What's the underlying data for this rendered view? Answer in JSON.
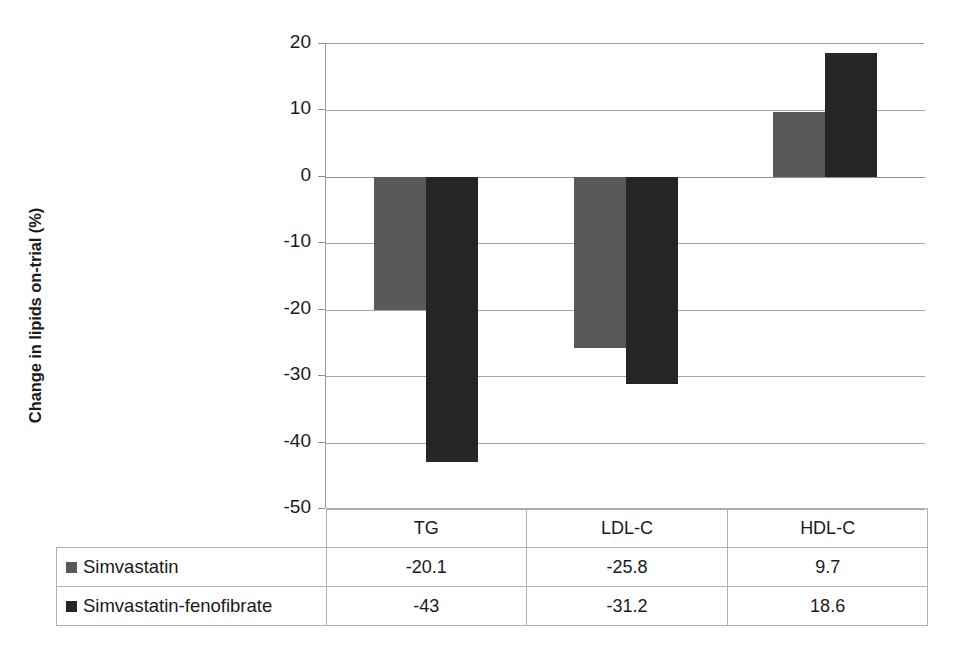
{
  "chart_data": {
    "type": "bar",
    "title": "",
    "xlabel": "",
    "ylabel": "Change in lipids on-trial (%)",
    "categories": [
      "TG",
      "LDL-C",
      "HDL-C"
    ],
    "series": [
      {
        "name": "Simvastatin",
        "color": "#595959",
        "values": [
          -20.1,
          -25.8,
          9.7
        ]
      },
      {
        "name": "Simvastatin-fenofibrate",
        "color": "#262626",
        "values": [
          -43,
          -31.2,
          18.6
        ]
      }
    ],
    "ylim": [
      -50,
      20
    ],
    "yticks": [
      20,
      10,
      0,
      -10,
      -20,
      -30,
      -40,
      -50
    ],
    "ytick_labels": [
      "20",
      "10",
      "0",
      "-10",
      "-20",
      "-30",
      "-40",
      "-50"
    ],
    "grid": true,
    "legend_position": "table-left",
    "data_table_visible": true
  },
  "axis": {
    "y_title": "Change in lipids on-trial (%)"
  },
  "table": {
    "corner_label": "",
    "column_headers": [
      "TG",
      "LDL-C",
      "HDL-C"
    ],
    "rows": [
      {
        "label": "Simvastatin",
        "swatch": "legend-swatch-simvastatin",
        "cells": [
          "-20.1",
          "-25.8",
          "9.7"
        ]
      },
      {
        "label": "Simvastatin-fenofibrate",
        "swatch": "legend-swatch-simvastatin-fenofibrate",
        "cells": [
          "-43",
          "-31.2",
          "18.6"
        ]
      }
    ]
  },
  "colors": {
    "series_light": "#595959",
    "series_dark": "#262626",
    "gridline": "#a6a6a6",
    "border": "#b0b0b0",
    "text": "#1a1a1a",
    "background": "#ffffff"
  }
}
